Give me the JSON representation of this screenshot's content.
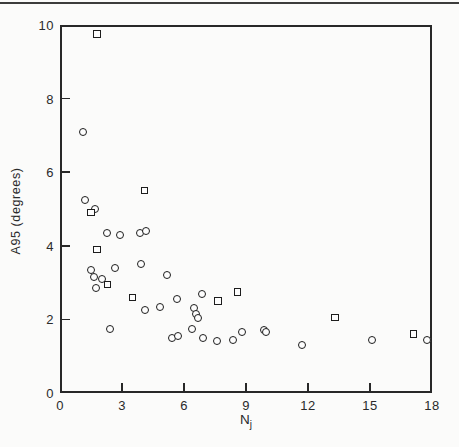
{
  "chart_data": {
    "type": "scatter",
    "title": "",
    "xlabel": {
      "base": "N",
      "sub": "j"
    },
    "ylabel": "A95 (degrees)",
    "xlim": [
      0,
      18
    ],
    "ylim": [
      0,
      10
    ],
    "x_ticks": [
      0,
      3,
      6,
      9,
      12,
      15,
      18
    ],
    "y_ticks": [
      0,
      2,
      4,
      6,
      8,
      10
    ],
    "grid": false,
    "legend": "none",
    "series": [
      {
        "name": "circle-markers",
        "marker": "circle",
        "points": [
          [
            1.1,
            7.1
          ],
          [
            1.2,
            5.25
          ],
          [
            1.7,
            5.0
          ],
          [
            2.25,
            4.35
          ],
          [
            2.9,
            4.3
          ],
          [
            3.85,
            4.35
          ],
          [
            4.15,
            4.4
          ],
          [
            1.5,
            3.35
          ],
          [
            1.65,
            3.15
          ],
          [
            2.05,
            3.1
          ],
          [
            2.65,
            3.4
          ],
          [
            3.9,
            3.5
          ],
          [
            5.2,
            3.2
          ],
          [
            1.75,
            2.85
          ],
          [
            4.1,
            2.25
          ],
          [
            4.85,
            2.35
          ],
          [
            5.65,
            2.55
          ],
          [
            6.85,
            2.7
          ],
          [
            6.5,
            2.3
          ],
          [
            6.6,
            2.15
          ],
          [
            6.7,
            2.05
          ],
          [
            2.4,
            1.75
          ],
          [
            5.4,
            1.5
          ],
          [
            5.7,
            1.55
          ],
          [
            6.4,
            1.75
          ],
          [
            6.9,
            1.5
          ],
          [
            7.6,
            1.4
          ],
          [
            8.35,
            1.45
          ],
          [
            8.8,
            1.65
          ],
          [
            9.85,
            1.7
          ],
          [
            9.95,
            1.65
          ],
          [
            11.7,
            1.3
          ],
          [
            15.1,
            1.45
          ],
          [
            17.75,
            1.45
          ]
        ]
      },
      {
        "name": "square-markers",
        "marker": "square",
        "points": [
          [
            1.8,
            9.75
          ],
          [
            4.1,
            5.5
          ],
          [
            1.5,
            4.9
          ],
          [
            1.8,
            3.9
          ],
          [
            2.3,
            2.95
          ],
          [
            3.5,
            2.6
          ],
          [
            7.65,
            2.5
          ],
          [
            8.6,
            2.75
          ],
          [
            13.3,
            2.05
          ],
          [
            17.1,
            1.6
          ]
        ]
      }
    ]
  }
}
